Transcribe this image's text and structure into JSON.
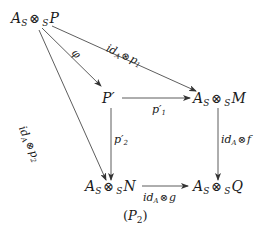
{
  "diagram": {
    "nodes": {
      "ASP": {
        "base": "A",
        "sub": "S",
        "op": "⊗",
        "pre": "S",
        "obj": "P"
      },
      "Pprime": {
        "text": "P′"
      },
      "ASM": {
        "base": "A",
        "sub": "S",
        "op": "⊗",
        "pre": "S",
        "obj": "M"
      },
      "ASN": {
        "base": "A",
        "sub": "S",
        "op": "⊗",
        "pre": "S",
        "obj": "N"
      },
      "ASQ": {
        "base": "A",
        "sub": "S",
        "op": "⊗",
        "pre": "S",
        "obj": "Q"
      }
    },
    "arrows": {
      "phi": {
        "label": "φ"
      },
      "top": {
        "id": "id",
        "sub": "A",
        "op": "⊗",
        "map": "p",
        "map_sub": "1"
      },
      "left": {
        "id": "id",
        "sub": "A",
        "op": "⊗",
        "map": "p",
        "map_sub": "2"
      },
      "p1prime": {
        "map": "p′",
        "map_sub": "1"
      },
      "p2prime": {
        "map": "p′",
        "map_sub": "2"
      },
      "right": {
        "id": "id",
        "sub": "A",
        "op": "⊗",
        "map": "f"
      },
      "bottom": {
        "id": "id",
        "sub": "A",
        "op": "⊗",
        "map": "g"
      }
    },
    "caption": {
      "open": "(",
      "name": "P",
      "sub": "2",
      "close": ")"
    },
    "colors": {
      "stroke": "#333333",
      "text": "#1a1a1a",
      "background": "#ffffff"
    }
  }
}
